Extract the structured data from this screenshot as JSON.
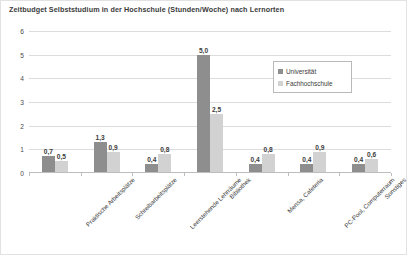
{
  "chart_data": {
    "type": "bar",
    "title": "Zeitbudget Selbststudium in der Hochschule (Stunden/Woche) nach Lernorten",
    "xlabel": "",
    "ylabel": "",
    "ylim": [
      0,
      6
    ],
    "yticks": [
      "0",
      "1",
      "2",
      "3",
      "4",
      "5",
      "6"
    ],
    "grid": true,
    "legend_position": "upper-right-inside",
    "categories": [
      "Praktische Arbeitsplätze",
      "Schreibarbeitsplätze",
      "Leerstehende Lehrräume",
      "Bibliothek",
      "Mensa, Cafeteria",
      "PC-Pool, Computerraum",
      "Sonstiges"
    ],
    "series": [
      {
        "name": "Universität",
        "color": "#8e8e8e",
        "values": [
          0.7,
          1.3,
          0.4,
          5.0,
          0.4,
          0.4,
          0.4
        ],
        "labels": [
          "0,7",
          "1,3",
          "0,4",
          "5,0",
          "0,4",
          "0,4",
          "0,4"
        ]
      },
      {
        "name": "Fachhochschule",
        "color": "#d2d2d2",
        "values": [
          0.5,
          0.9,
          0.8,
          2.5,
          0.8,
          0.9,
          0.6
        ],
        "labels": [
          "0,5",
          "0,9",
          "0,8",
          "2,5",
          "0,8",
          "0,9",
          "0,6"
        ]
      }
    ]
  }
}
